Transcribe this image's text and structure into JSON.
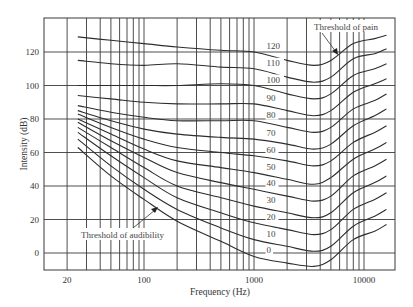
{
  "chart_data": {
    "type": "line",
    "title": "",
    "xlabel": "Frequency (Hz)",
    "ylabel": "Intensity (dB)",
    "x_scale": "log",
    "xlim": [
      15,
      18000
    ],
    "ylim": [
      -10,
      140
    ],
    "x_tick_labels": [
      "20",
      "100",
      "1000",
      "10000"
    ],
    "x_ticks": [
      20,
      100,
      1000,
      10000
    ],
    "y_tick_labels": [
      "0",
      "20",
      "40",
      "60",
      "80",
      "100",
      "120"
    ],
    "y_ticks": [
      0,
      20,
      40,
      60,
      80,
      100,
      120
    ],
    "grid": true,
    "x_gridlines": [
      20,
      30,
      40,
      50,
      60,
      70,
      80,
      90,
      100,
      200,
      300,
      400,
      500,
      600,
      700,
      800,
      900,
      1000,
      2000,
      3000,
      4000,
      5000,
      6000,
      7000,
      8000,
      9000,
      10000
    ],
    "y_gridlines": [
      0,
      20,
      40,
      60,
      80,
      100,
      120
    ],
    "x": [
      25,
      50,
      100,
      200,
      500,
      1000,
      2000,
      3500,
      5000,
      8000,
      12500,
      16000
    ],
    "series": [
      {
        "name": "0",
        "values": [
          63,
          46,
          32,
          19,
          7,
          -2,
          -6,
          -8,
          -4,
          8,
          13,
          17
        ]
      },
      {
        "name": "10",
        "values": [
          68,
          52,
          38,
          26,
          15,
          8,
          4,
          1,
          4,
          16,
          22,
          26
        ]
      },
      {
        "name": "20",
        "values": [
          72,
          58,
          45,
          33,
          24,
          18,
          14,
          11,
          14,
          26,
          32,
          36
        ]
      },
      {
        "name": "30",
        "values": [
          75,
          63,
          51,
          40,
          33,
          28,
          24,
          21,
          24,
          36,
          42,
          46
        ]
      },
      {
        "name": "40",
        "values": [
          78,
          67,
          57,
          48,
          42,
          38,
          34,
          31,
          34,
          46,
          52,
          56
        ]
      },
      {
        "name": "50",
        "values": [
          80,
          71,
          62,
          55,
          51,
          48,
          44,
          41,
          45,
          56,
          62,
          66
        ]
      },
      {
        "name": "60",
        "values": [
          83,
          75,
          68,
          63,
          60,
          58,
          55,
          52,
          55,
          66,
          72,
          76
        ]
      },
      {
        "name": "70",
        "values": [
          85,
          79,
          74,
          71,
          69,
          68,
          65,
          62,
          65,
          76,
          82,
          86
        ]
      },
      {
        "name": "80",
        "values": [
          88,
          84,
          81,
          79,
          79,
          79,
          75,
          72,
          75,
          86,
          91,
          95
        ]
      },
      {
        "name": "90",
        "values": [
          94,
          92,
          90,
          89,
          89,
          89,
          85,
          82,
          85,
          96,
          101,
          104
        ]
      },
      {
        "name": "100",
        "values": [
          100,
          100,
          100,
          100,
          101,
          100,
          95,
          92,
          95,
          106,
          110,
          113
        ]
      },
      {
        "name": "110",
        "values": [
          115,
          113,
          112,
          113,
          111,
          110,
          105,
          102,
          105,
          116,
          119,
          122
        ]
      },
      {
        "name": "120",
        "values": [
          129,
          127,
          125,
          123,
          121,
          120,
          115,
          112,
          115,
          125,
          128,
          130
        ]
      }
    ],
    "annotations": [
      {
        "text": "Threshold of pain",
        "arrow_to": {
          "x": 6000,
          "y": 116
        }
      },
      {
        "text": "Threshold of audibility",
        "arrow_to": {
          "x": 180,
          "y": 27
        }
      }
    ],
    "legend": "inline curve labels at ~1300 Hz"
  },
  "labels": {
    "xlabel": "Frequency (Hz)",
    "ylabel": "Intensity (dB)",
    "pain": "Threshold of pain",
    "audibility": "Threshold of audibility"
  },
  "curve_labels": [
    "0",
    "10",
    "20",
    "30",
    "40",
    "50",
    "60",
    "70",
    "80",
    "90",
    "100",
    "110",
    "120"
  ]
}
